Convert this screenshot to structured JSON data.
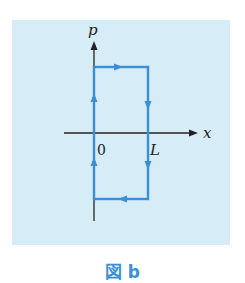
{
  "figure": {
    "caption": "図 b",
    "panel_color": "#d6ecf7",
    "path_color": "#3a8fd9",
    "axis_color": "#222222"
  },
  "axes": {
    "vertical_label": "p",
    "horizontal_label": "x",
    "origin_label": "0",
    "right_edge_label": "L"
  },
  "path": {
    "shape": "rectangle",
    "direction": "clockwise",
    "corners": [
      [
        0,
        "p_max"
      ],
      [
        "L",
        "p_max"
      ],
      [
        "L",
        "-p_max"
      ],
      [
        0,
        "-p_max"
      ]
    ],
    "arrows": [
      "top: right",
      "right: down",
      "right: down",
      "bottom: left",
      "left: up",
      "left: up"
    ]
  }
}
